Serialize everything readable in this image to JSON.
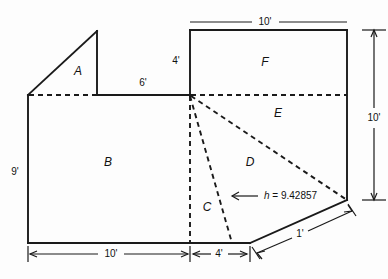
{
  "figure": {
    "stroke_color": "#1a1a1a",
    "background_color": "#fdfdfd"
  },
  "regions": [
    {
      "id": "A",
      "label": "A",
      "x": 78,
      "y": 72
    },
    {
      "id": "B",
      "label": "B",
      "x": 108,
      "y": 163
    },
    {
      "id": "C",
      "label": "C",
      "x": 207,
      "y": 208
    },
    {
      "id": "D",
      "label": "D",
      "x": 250,
      "y": 163
    },
    {
      "id": "E",
      "label": "E",
      "x": 278,
      "y": 114
    },
    {
      "id": "F",
      "label": "F",
      "x": 265,
      "y": 63
    }
  ],
  "dimensions": [
    {
      "id": "top-10",
      "label": "10'",
      "x": 265,
      "y": 22
    },
    {
      "id": "riser-4",
      "label": "4'",
      "x": 176,
      "y": 61
    },
    {
      "id": "span-6",
      "label": "6'",
      "x": 143,
      "y": 83
    },
    {
      "id": "right-10",
      "label": "10'",
      "x": 374,
      "y": 118
    },
    {
      "id": "left-9",
      "label": "9'",
      "x": 15,
      "y": 172
    },
    {
      "id": "bottom-10",
      "label": "10'",
      "x": 110,
      "y": 254
    },
    {
      "id": "bottom-4",
      "label": "4'",
      "x": 219,
      "y": 254
    },
    {
      "id": "slant-1",
      "label": "1'",
      "x": 300,
      "y": 234
    }
  ],
  "annotations": [
    {
      "id": "height-note",
      "variable": "h",
      "equals": " = ",
      "value": "9.42857",
      "x": 264,
      "y": 196
    }
  ],
  "geometry": {
    "outline_points": "28,95 28,243 250,243 347,200 347,30 190,30 190,95 97,95 97,31 28,95",
    "solid_segments": [
      "28,95 28,243",
      "28,243 250,243",
      "250,243 347,200",
      "347,200 347,30",
      "347,30 190,30",
      "190,30 190,95",
      "190,95 97,95",
      "97,95 97,31",
      "97,31 28,95"
    ],
    "dashed_segments": [
      "28,95 190,95",
      "190,95 347,95",
      "190,95 190,243",
      "190,95 232,243",
      "190,95 347,200"
    ]
  },
  "colors": {
    "ink": "#1a1a1a",
    "paper": "#fdfdfd"
  }
}
